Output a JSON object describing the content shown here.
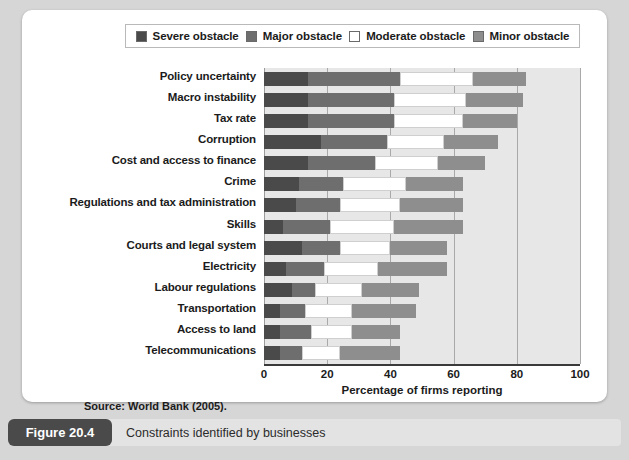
{
  "figure": {
    "tag": "Figure 20.4",
    "caption": "Constraints identified by businesses",
    "source": "Source: World Bank (2005)."
  },
  "legend": {
    "position": "top",
    "items": [
      {
        "label": "Severe obstacle",
        "color": "#4a4a4a",
        "icon": "legend-swatch"
      },
      {
        "label": "Major obstacle",
        "color": "#6e6e6e",
        "icon": "legend-swatch"
      },
      {
        "label": "Moderate obstacle",
        "color": "#ffffff",
        "icon": "legend-swatch"
      },
      {
        "label": "Minor obstacle",
        "color": "#8e8e8e",
        "icon": "legend-swatch"
      }
    ]
  },
  "chart_data": {
    "type": "bar",
    "orientation": "horizontal",
    "stacked": true,
    "title": "",
    "subtitle": "",
    "xlabel": "Percentage of firms reporting",
    "ylabel": "",
    "xlim": [
      0,
      100
    ],
    "xticks": [
      0,
      20,
      40,
      60,
      80,
      100
    ],
    "grid": true,
    "grid_axis": "x",
    "legend_position": "top",
    "categories": [
      "Policy uncertainty",
      "Macro instability",
      "Tax rate",
      "Corruption",
      "Cost and access to finance",
      "Crime",
      "Regulations and tax administration",
      "Skills",
      "Courts and legal system",
      "Electricity",
      "Labour regulations",
      "Transportation",
      "Access to land",
      "Telecommunications"
    ],
    "series": [
      {
        "name": "Severe obstacle",
        "color": "#4a4a4a",
        "values": [
          14,
          14,
          14,
          18,
          14,
          11,
          10,
          6,
          12,
          7,
          9,
          5,
          5,
          5
        ]
      },
      {
        "name": "Major obstacle",
        "color": "#6e6e6e",
        "values": [
          29,
          27,
          27,
          21,
          21,
          14,
          14,
          15,
          12,
          12,
          7,
          8,
          10,
          7
        ]
      },
      {
        "name": "Moderate obstacle",
        "color": "#ffffff",
        "values": [
          23,
          23,
          22,
          18,
          20,
          20,
          19,
          20,
          16,
          17,
          15,
          15,
          13,
          12
        ]
      },
      {
        "name": "Minor obstacle",
        "color": "#8e8e8e",
        "values": [
          17,
          18,
          17,
          17,
          15,
          18,
          20,
          22,
          18,
          22,
          18,
          20,
          15,
          19
        ]
      }
    ],
    "totals": [
      83,
      82,
      80,
      74,
      70,
      63,
      63,
      63,
      58,
      58,
      49,
      48,
      43,
      43
    ]
  },
  "xticklabels": [
    "0",
    "20",
    "40",
    "60",
    "80",
    "100"
  ]
}
